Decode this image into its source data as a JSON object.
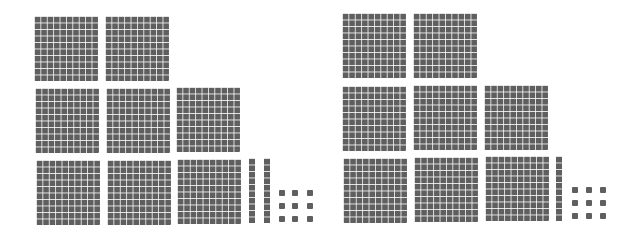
{
  "diagram": {
    "type": "base-ten-blocks",
    "colors": {
      "block": "#5f5f5f",
      "grid": "#ffffff",
      "background": "#ffffff"
    },
    "panels": [
      {
        "name": "left",
        "hundreds": 8,
        "tens": 2,
        "ones": 9,
        "value": 829,
        "label": "829"
      },
      {
        "name": "right",
        "hundreds": 8,
        "tens": 1,
        "ones": 9,
        "value": 819,
        "label": "819"
      }
    ]
  }
}
